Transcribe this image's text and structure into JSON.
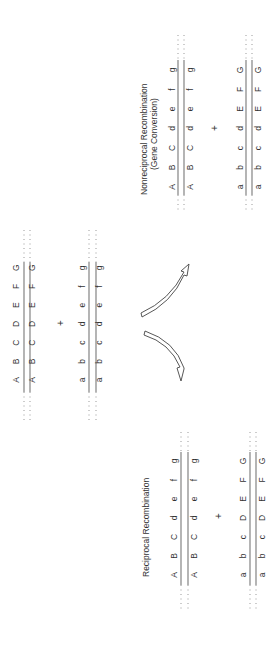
{
  "figure": {
    "orientation": "rotated-90-ccw",
    "parent": {
      "top_chromatid_pair": [
        "A",
        "B",
        "C",
        "D",
        "E",
        "F",
        "G"
      ],
      "bottom_chromatid_pair": [
        "a",
        "b",
        "c",
        "d",
        "e",
        "f",
        "g"
      ],
      "plus": "+"
    },
    "nonreciprocal": {
      "title_line1": "Nonreciprocal Recombination",
      "title_line2": "(Gene Conversion)",
      "top_chromatid_pair": [
        "A",
        "B",
        "C",
        "d",
        "e",
        "f",
        "g"
      ],
      "bottom_chromatid_pair": [
        "a",
        "b",
        "c",
        "d",
        "E",
        "F",
        "G"
      ],
      "plus": "+"
    },
    "reciprocal": {
      "title": "Reciprocal Recombination",
      "top_chromatid_pair": [
        "A",
        "B",
        "C",
        "d",
        "e",
        "f",
        "g"
      ],
      "bottom_chromatid_pair": [
        "a",
        "b",
        "c",
        "D",
        "E",
        "F",
        "G"
      ],
      "plus": "+"
    },
    "arrows": [
      "arrow-to-nonreciprocal",
      "arrow-to-reciprocal"
    ],
    "colors": {
      "text": "#333333",
      "line": "#777777",
      "arrow_stroke": "#444444",
      "background": "#ffffff"
    }
  }
}
